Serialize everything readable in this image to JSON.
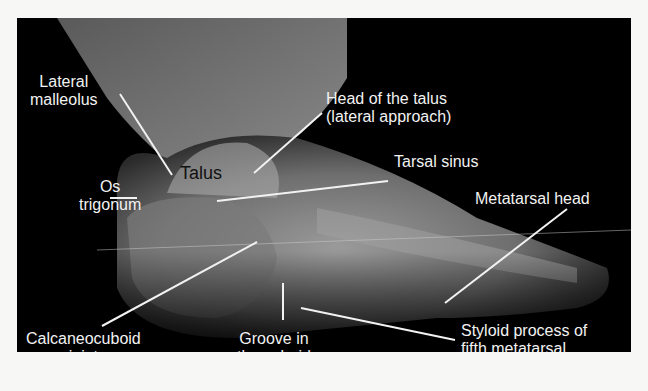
{
  "figure": {
    "labels": {
      "lateral_malleolus": [
        "Lateral",
        "malleolus"
      ],
      "head_of_talus": [
        "Head of the talus",
        "(lateral approach)"
      ],
      "talus": "Talus",
      "tarsal_sinus": "Tarsal sinus",
      "os_trigonum": [
        "Os",
        "trigonum"
      ],
      "metatarsal_head": "Metatarsal head",
      "calcaneocuboid_joint": [
        "Calcaneocuboid",
        "joint"
      ],
      "groove_in_cuboid": [
        "Groove in",
        "the cuboid"
      ],
      "styloid_process": [
        "Styloid process of",
        "fifth metatarsal"
      ]
    }
  }
}
